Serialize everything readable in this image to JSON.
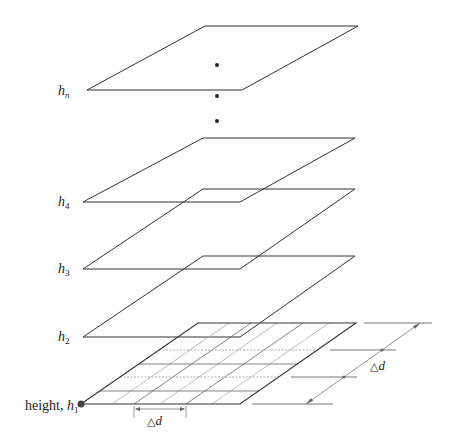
{
  "diagram": {
    "type": "stacked-planes",
    "colors": {
      "line": "#333333",
      "grid": "#999999",
      "dot": "#222222",
      "background": "#ffffff"
    },
    "planes": [
      {
        "id": "hn",
        "label_main": "h",
        "label_sub": "n",
        "label_x": 58,
        "label_y": 95,
        "pts": "87,90 205,26 358,26 242,90"
      },
      {
        "id": "h4",
        "label_main": "h",
        "label_sub": "4",
        "label_x": 58,
        "label_y": 206,
        "pts": "83,202 203,138 355,138 240,202"
      },
      {
        "id": "h3",
        "label_main": "h",
        "label_sub": "3",
        "label_x": 58,
        "label_y": 273,
        "pts": "83,269 203,189 355,189 240,269"
      },
      {
        "id": "h2",
        "label_main": "h",
        "label_sub": "2",
        "label_x": 58,
        "label_y": 341,
        "pts": "83,337 203,256 355,256 240,337"
      },
      {
        "id": "h1",
        "label_prefix": "height, ",
        "label_main": "h",
        "label_sub": "1",
        "label_x": 25,
        "label_y": 410,
        "pts": "81,404 198,323 356,323 240,404"
      }
    ],
    "ellipsis_dots": [
      [
        217,
        65
      ],
      [
        217,
        96
      ],
      [
        217,
        121
      ]
    ],
    "base_point": [
      81,
      404
    ],
    "grid": {
      "rows": 4,
      "cols": 5,
      "note": "regular grid cells on base plane h1"
    },
    "dimension_labels": {
      "horizontal": "△d",
      "diagonal": "△d"
    }
  }
}
